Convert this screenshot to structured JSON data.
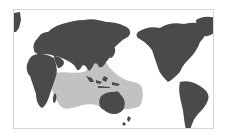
{
  "map": {
    "type": "world-distribution-map",
    "projection": "Pacific-centered equirectangular",
    "center_meridian": "Pacific (~150°E)",
    "colors": {
      "background": "#ffffff",
      "frame": "#d6d6d6",
      "land": "#4a4a4a",
      "range": "#c2c2c2"
    },
    "highlighted_region": {
      "label": "Indo-Pacific distribution range",
      "extent": "East African coast and Madagascar east across the Indian Ocean, Southeast Asia, Indonesia, northern Australia, Melanesia to the central-western Pacific; north to southern Japan"
    },
    "continents_shown": [
      "Africa",
      "Europe",
      "Asia",
      "Australia",
      "North America",
      "South America",
      "Greenland"
    ],
    "text_labels": []
  }
}
